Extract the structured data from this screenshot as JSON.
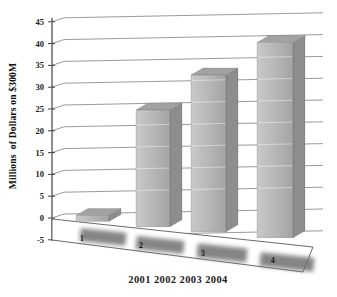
{
  "chart_data": {
    "type": "bar",
    "projection": "3d-perspective",
    "title": "",
    "ylabel": "Millions  of Dollars on $300M",
    "xlabel": "2001 2002 2003 2004",
    "categories": [
      "1",
      "2",
      "3",
      "4"
    ],
    "series_years": [
      "2001",
      "2002",
      "2003",
      "2004"
    ],
    "values": [
      1,
      26,
      33,
      40
    ],
    "ylim": [
      -5,
      45
    ],
    "ytick_step": 5,
    "yticks": [
      45,
      40,
      35,
      30,
      25,
      20,
      15,
      10,
      5,
      0,
      -5
    ],
    "grid": true,
    "legend": false,
    "floor_shadows": true
  },
  "colors": {
    "background": "#ffffff",
    "bar_front_light": "#c9c9c9",
    "bar_front_mid": "#b9b9b9",
    "bar_front_dark": "#a3a3a3",
    "bar_side": "#8d8d8d",
    "bar_top": "#a2a2a2",
    "bar_edge": "rgba(70,70,70,0.35)",
    "gridline": "#8f8f8f",
    "axis": "#444444",
    "floor_line": "#6a6a6a",
    "shadow": "#707070",
    "text": "#1a1a1a"
  }
}
